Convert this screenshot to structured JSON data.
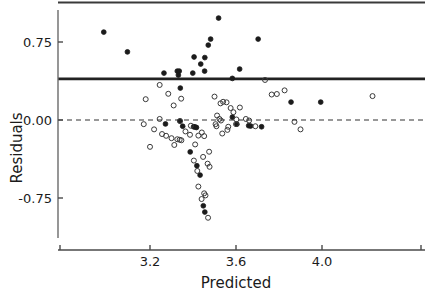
{
  "chart_data": {
    "type": "scatter",
    "title": "",
    "xlabel": "Predicted",
    "ylabel": "Residuals",
    "xlim": [
      2.95,
      4.3
    ],
    "ylim": [
      -1.05,
      1.02
    ],
    "xticks": [
      3.2,
      3.6,
      4.0
    ],
    "xtick_labels": [
      "3.2",
      "3.6",
      "4.0"
    ],
    "yticks": [
      0.75,
      0.0,
      -0.75
    ],
    "ytick_labels": [
      "0.75",
      "0.00",
      "-0.75"
    ],
    "grid": false,
    "legend": null,
    "reference_lines": [
      {
        "name": "zero-line",
        "type": "horizontal",
        "y": 0.0,
        "style": "dashed",
        "color": "#333333",
        "width": 1.2
      },
      {
        "name": "threshold-line",
        "type": "horizontal",
        "y": 0.395,
        "style": "solid",
        "color": "#222222",
        "width": 2.6
      },
      {
        "name": "top-frame-line",
        "type": "horizontal",
        "y": 1.02,
        "style": "solid",
        "color": "#3a3a3a",
        "width": 2.2
      }
    ],
    "series": [
      {
        "name": "flagged-residuals",
        "marker": "filled-circle",
        "color": "#1b1b1b",
        "points": [
          [
            2.985,
            0.845
          ],
          [
            3.095,
            0.655
          ],
          [
            3.265,
            0.451
          ],
          [
            3.327,
            0.47
          ],
          [
            3.336,
            0.47
          ],
          [
            3.332,
            0.432
          ],
          [
            3.399,
            0.451
          ],
          [
            3.405,
            0.606
          ],
          [
            3.455,
            0.6
          ],
          [
            3.471,
            0.72
          ],
          [
            3.436,
            0.538
          ],
          [
            3.454,
            0.47
          ],
          [
            3.482,
            0.778
          ],
          [
            3.519,
            0.98
          ],
          [
            3.583,
            0.4
          ],
          [
            3.617,
            0.49
          ],
          [
            3.703,
            0.778
          ],
          [
            3.341,
            0.307
          ],
          [
            3.352,
            -0.06
          ],
          [
            3.403,
            -0.065
          ],
          [
            3.409,
            -0.067
          ],
          [
            3.416,
            -0.072
          ],
          [
            3.272,
            -0.038
          ],
          [
            3.339,
            -0.01
          ],
          [
            3.604,
            -0.04
          ],
          [
            3.659,
            -0.055
          ],
          [
            3.668,
            -0.058
          ],
          [
            3.719,
            -0.065
          ],
          [
            3.856,
            0.172
          ],
          [
            3.994,
            0.172
          ],
          [
            3.387,
            -0.307
          ],
          [
            3.418,
            -0.44
          ],
          [
            3.433,
            -0.53
          ],
          [
            3.448,
            -0.825
          ],
          [
            3.455,
            -0.885
          ],
          [
            3.583,
            0.028
          ]
        ]
      },
      {
        "name": "residuals",
        "marker": "open-circle",
        "color": "#3a3a3a",
        "points": [
          [
            3.245,
            0.337
          ],
          [
            3.285,
            0.252
          ],
          [
            3.31,
            0.14
          ],
          [
            3.345,
            0.205
          ],
          [
            3.245,
            0.01
          ],
          [
            3.34,
            -0.01
          ],
          [
            3.275,
            -0.152
          ],
          [
            3.3,
            -0.175
          ],
          [
            3.327,
            -0.185
          ],
          [
            3.338,
            -0.19
          ],
          [
            3.346,
            -0.195
          ],
          [
            3.313,
            -0.24
          ],
          [
            3.256,
            -0.135
          ],
          [
            3.219,
            -0.09
          ],
          [
            3.2,
            -0.258
          ],
          [
            3.171,
            -0.04
          ],
          [
            3.5,
            0.225
          ],
          [
            3.528,
            0.16
          ],
          [
            3.54,
            0.175
          ],
          [
            3.523,
            0.01
          ],
          [
            3.512,
            0.043
          ],
          [
            3.505,
            -0.04
          ],
          [
            3.509,
            -0.06
          ],
          [
            3.53,
            -0.005
          ],
          [
            3.536,
            -0.13
          ],
          [
            3.556,
            0.17
          ],
          [
            3.575,
            0.115
          ],
          [
            3.588,
            0.075
          ],
          [
            3.564,
            -0.065
          ],
          [
            3.56,
            -0.095
          ],
          [
            3.602,
            0.005
          ],
          [
            3.6,
            -0.04
          ],
          [
            3.618,
            0.12
          ],
          [
            3.646,
            0.01
          ],
          [
            3.661,
            -0.005
          ],
          [
            3.69,
            -0.06
          ],
          [
            3.735,
            0.385
          ],
          [
            3.766,
            0.245
          ],
          [
            3.79,
            0.25
          ],
          [
            3.826,
            0.285
          ],
          [
            3.872,
            -0.018
          ],
          [
            3.9,
            -0.09
          ],
          [
            4.235,
            0.23
          ],
          [
            3.386,
            -0.142
          ],
          [
            3.425,
            -0.15
          ],
          [
            3.441,
            -0.12
          ],
          [
            3.452,
            -0.155
          ],
          [
            3.404,
            -0.39
          ],
          [
            3.447,
            -0.355
          ],
          [
            3.468,
            -0.42
          ],
          [
            3.477,
            -0.45
          ],
          [
            3.42,
            -0.49
          ],
          [
            3.425,
            -0.64
          ],
          [
            3.452,
            -0.705
          ],
          [
            3.458,
            -0.725
          ],
          [
            3.44,
            -0.76
          ],
          [
            3.47,
            -0.94
          ],
          [
            3.41,
            -0.235
          ],
          [
            3.475,
            -0.305
          ],
          [
            3.39,
            -0.055
          ],
          [
            3.365,
            -0.11
          ],
          [
            3.18,
            0.2
          ]
        ]
      }
    ]
  },
  "axes": {
    "x_axis_name": "x-axis",
    "y_axis_name": "y-axis"
  }
}
